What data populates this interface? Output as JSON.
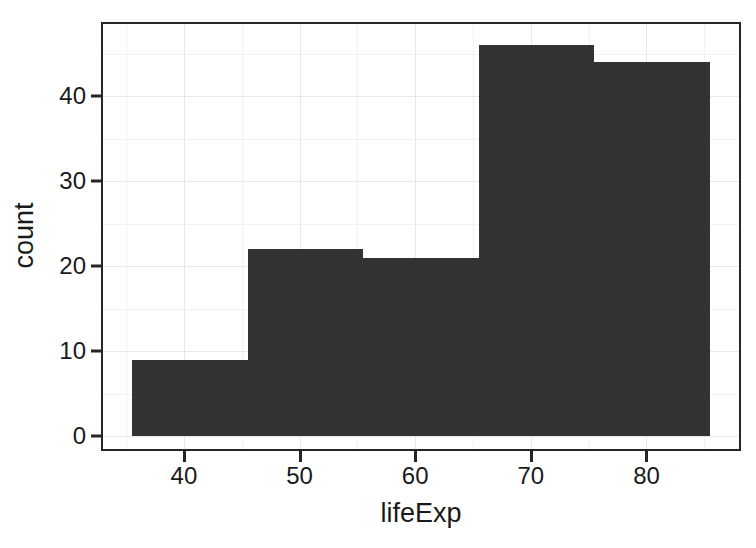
{
  "chart_data": {
    "type": "bar",
    "subtype": "histogram",
    "title": "",
    "xlabel": "lifeExp",
    "ylabel": "count",
    "xlim": [
      33.0,
      88.0
    ],
    "ylim": [
      -1.5,
      48.5
    ],
    "xticks": [
      40,
      50,
      60,
      70,
      80
    ],
    "yticks": [
      0,
      10,
      20,
      30,
      40
    ],
    "xtick_labels": [
      "40",
      "50",
      "60",
      "70",
      "80"
    ],
    "ytick_labels": [
      "0",
      "10",
      "20",
      "30",
      "40"
    ],
    "x_minor_ticks": [
      35,
      45,
      55,
      65,
      75,
      85
    ],
    "y_minor_ticks": [
      5,
      15,
      25,
      35,
      45
    ],
    "bin_width": 10,
    "bin_edges": [
      35.5,
      45.5,
      55.5,
      65.5,
      75.5,
      85.5
    ],
    "categories": [
      "35.5-45.5",
      "45.5-55.5",
      "55.5-65.5",
      "65.5-75.5",
      "75.5-85.5"
    ],
    "values": [
      9,
      22,
      21,
      46,
      44
    ],
    "bar_color": "#333333",
    "panel_background": "#ffffff",
    "grid_major_color": "#e8e8ec",
    "grid_minor_color": "#f2f2f5",
    "axis_color": "#262626",
    "text_color": "#1a1a1a",
    "grid": true,
    "legend": false,
    "legend_position": "none"
  }
}
